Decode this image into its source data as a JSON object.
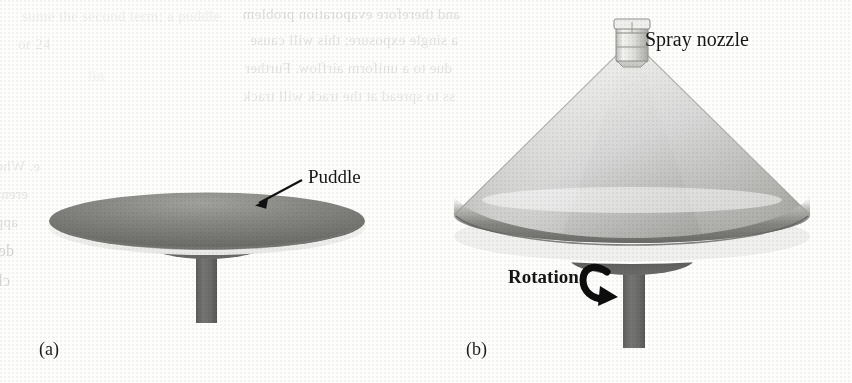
{
  "figure": {
    "type": "technical-illustration",
    "panels": [
      {
        "id": "a",
        "label": "(a)",
        "annotation": "Puddle"
      },
      {
        "id": "b",
        "label": "(b)",
        "annotations": [
          "Spray nozzle",
          "Rotation"
        ]
      }
    ]
  },
  "labels": {
    "panel_a": "(a)",
    "panel_b": "(b)",
    "puddle": "Puddle",
    "spray_nozzle": "Spray nozzle",
    "rotation": "Rotation"
  },
  "colors": {
    "page_background": "#fdfdfc",
    "puddle_dark": "#6f6f6d",
    "puddle_mid": "#8a8a87",
    "disk_shadow": "#5a5a58",
    "shaft_gray": "#6a6a68",
    "cone_light": "#fbfbfa",
    "cone_mid": "#b9b9b6",
    "cone_dark": "#70706e",
    "ink_black": "#161616",
    "ghost_gray": "#3a3a38"
  },
  "ghost_text": {
    "note": "faint ink bleed-through from the reverse side of the scanned page",
    "lines": [
      {
        "text": "sume the second term; a puddle",
        "x": 22,
        "y": 8,
        "size": 15,
        "opacity": 0.07,
        "mirror": false
      },
      {
        "text": "and therefore evaporation problem",
        "x": 460,
        "y": 6,
        "size": 15,
        "opacity": 0.16,
        "mirror": true
      },
      {
        "text": "or 24",
        "x": 18,
        "y": 36,
        "size": 15,
        "opacity": 0.09,
        "mirror": false
      },
      {
        "text": "a single exposure; this will cause",
        "x": 458,
        "y": 32,
        "size": 15,
        "opacity": 0.14,
        "mirror": true
      },
      {
        "text": "due to a uniform airflow. Further",
        "x": 452,
        "y": 60,
        "size": 15,
        "opacity": 0.13,
        "mirror": true
      },
      {
        "text": "ss to spread at the track will track",
        "x": 455,
        "y": 88,
        "size": 15,
        "opacity": 0.11,
        "mirror": true
      },
      {
        "text": "lin",
        "x": 88,
        "y": 68,
        "size": 15,
        "opacity": 0.06,
        "mirror": false
      },
      {
        "text": "e. Whether",
        "x": 40,
        "y": 158,
        "size": 15,
        "opacity": 0.1,
        "mirror": true
      },
      {
        "text": "erential to pull a resist unevenly to solve",
        "x": 28,
        "y": 186,
        "size": 15,
        "opacity": 0.12,
        "mirror": true
      },
      {
        "text": "applicable for rotating. the exposure problem",
        "x": 18,
        "y": 214,
        "size": 15,
        "opacity": 0.15,
        "mirror": true
      },
      {
        "text": "depends on heat. Eliminate the evaporation",
        "x": 14,
        "y": 242,
        "size": 16,
        "opacity": 0.2,
        "mirror": true
      },
      {
        "text": "characteristics of the photoresist in the substrate and surface or puddle",
        "x": 10,
        "y": 272,
        "size": 16,
        "opacity": 0.18,
        "mirror": true
      }
    ]
  }
}
